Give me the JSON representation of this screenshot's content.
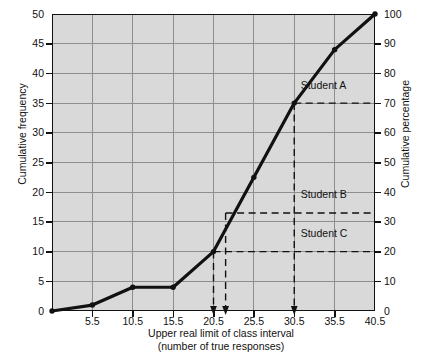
{
  "chart_data": {
    "type": "line",
    "title": "",
    "xlabel": "Upper real limit of class interval",
    "xlabel_sub": "(number of true responses)",
    "ylabel": "Cumulative frequency",
    "ylabel_right": "Cumulative percentage",
    "x": [
      0.5,
      5.5,
      10.5,
      15.5,
      20.5,
      25.5,
      30.5,
      35.5,
      40.5
    ],
    "values": [
      0,
      1,
      4,
      4,
      10,
      22.5,
      35,
      44,
      50
    ],
    "xlim": [
      0.5,
      40.5
    ],
    "ylim": [
      0,
      50
    ],
    "ylim_right": [
      0,
      100
    ],
    "xticks": [
      "5.5",
      "10.5",
      "15.5",
      "20.5",
      "25.5",
      "30.5",
      "35.5",
      "40.5"
    ],
    "xtick_values": [
      5.5,
      10.5,
      15.5,
      20.5,
      25.5,
      30.5,
      35.5,
      40.5
    ],
    "yticks_left": [
      "0",
      "5",
      "10",
      "15",
      "20",
      "25",
      "30",
      "35",
      "40",
      "45",
      "50"
    ],
    "ytick_left_values": [
      0,
      5,
      10,
      15,
      20,
      25,
      30,
      35,
      40,
      45,
      50
    ],
    "yticks_right": [
      "0",
      "10",
      "20",
      "30",
      "40",
      "50",
      "60",
      "70",
      "80",
      "90",
      "100"
    ],
    "ytick_right_values": [
      0,
      10,
      20,
      30,
      40,
      50,
      60,
      70,
      80,
      90,
      100
    ],
    "grid": true,
    "legend": "none",
    "line_color": "#111111",
    "plot_bg": "#d9d9d9",
    "grid_color": "#8e8e8e",
    "markers": true,
    "annotations": [
      {
        "label": "Student A",
        "x": 30.5,
        "y_left": 35,
        "y_right": 70,
        "label_x": 31.3,
        "label_y": 38.0
      },
      {
        "label": "Student B",
        "x": 22.0,
        "y_left": 16.5,
        "y_right": 33,
        "label_x": 31.3,
        "label_y": 19.6
      },
      {
        "label": "Student C",
        "x": 20.5,
        "y_left": 10,
        "y_right": 20,
        "label_x": 31.3,
        "label_y": 13.0
      }
    ],
    "arrows": [
      {
        "x": 20.5,
        "for": "Student C"
      },
      {
        "x": 22.0,
        "for": "Student B"
      },
      {
        "x": 30.5,
        "for": "Student A"
      }
    ]
  }
}
